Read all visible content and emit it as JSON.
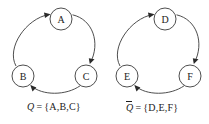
{
  "figure": {
    "width": 209,
    "height": 124,
    "background": "#ffffff",
    "stroke_color": "#3a3a3a",
    "text_color": "#1c1c1c",
    "arrow_color": "#2a2a2a"
  },
  "clusters": [
    {
      "id": "left-cluster",
      "nodes": [
        {
          "id": "A",
          "label": "A",
          "cx": 61,
          "cy": 19,
          "r": 11
        },
        {
          "id": "B",
          "label": "B",
          "cx": 23,
          "cy": 76,
          "r": 11
        },
        {
          "id": "C",
          "label": "C",
          "cx": 86,
          "cy": 76,
          "r": 11
        }
      ],
      "edges": [
        {
          "id": "B-to-A",
          "from": "B",
          "to": "A"
        },
        {
          "id": "A-to-C",
          "from": "A",
          "to": "C"
        },
        {
          "id": "C-to-B",
          "from": "C",
          "to": "B"
        }
      ],
      "caption": {
        "symbol": "Q",
        "overbar": false,
        "equals": "=",
        "set": "{A,B,C}"
      }
    },
    {
      "id": "right-cluster",
      "nodes": [
        {
          "id": "D",
          "label": "D",
          "cx": 165,
          "cy": 19,
          "r": 11
        },
        {
          "id": "E",
          "label": "E",
          "cx": 127,
          "cy": 76,
          "r": 11
        },
        {
          "id": "F",
          "label": "F",
          "cx": 190,
          "cy": 76,
          "r": 11
        }
      ],
      "edges": [
        {
          "id": "E-to-D",
          "from": "E",
          "to": "D"
        },
        {
          "id": "D-to-F",
          "from": "D",
          "to": "F"
        },
        {
          "id": "F-to-E",
          "from": "F",
          "to": "E"
        }
      ],
      "caption": {
        "symbol": "Q",
        "overbar": true,
        "equals": "=",
        "set": "{D,E,F}"
      }
    }
  ]
}
